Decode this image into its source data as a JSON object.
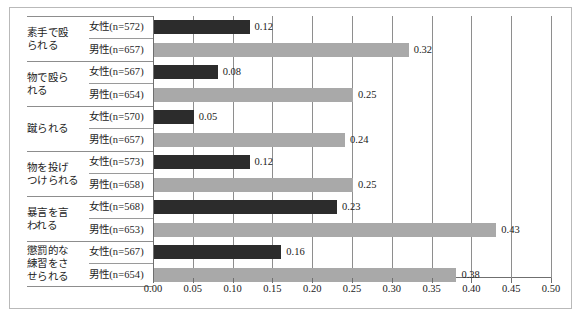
{
  "chart_data": {
    "type": "bar",
    "orientation": "horizontal",
    "title": "",
    "xlabel": "",
    "ylabel": "",
    "xlim": [
      0.0,
      0.5
    ],
    "xticks": [
      "0.00",
      "0.05",
      "0.10",
      "0.15",
      "0.20",
      "0.25",
      "0.30",
      "0.35",
      "0.40",
      "0.45",
      "0.50"
    ],
    "xtick_values": [
      0.0,
      0.05,
      0.1,
      0.15,
      0.2,
      0.25,
      0.3,
      0.35,
      0.4,
      0.45,
      0.5
    ],
    "grid": true,
    "grid_axis": "x",
    "legend": "none",
    "categories": [
      "素手で殴られる",
      "物で殴られる",
      "蹴られる",
      "物を投げつけられる",
      "暴言を言われる",
      "懲罰的な練習をさせられる"
    ],
    "series": [
      {
        "name": "女性",
        "color": "#2c2c2c",
        "values": [
          0.12,
          0.08,
          0.05,
          0.12,
          0.23,
          0.16
        ],
        "value_labels": [
          "0.12",
          "0.08",
          "0.05",
          "0.12",
          "0.23",
          "0.16"
        ],
        "n_labels": [
          "女性(n=572)",
          "女性(n=567)",
          "女性(n=570)",
          "女性(n=573)",
          "女性(n=568)",
          "女性(n=567)"
        ],
        "n_values": [
          572,
          567,
          570,
          573,
          568,
          567
        ]
      },
      {
        "name": "男性",
        "color": "#a9a9a9",
        "values": [
          0.32,
          0.25,
          0.24,
          0.25,
          0.43,
          0.38
        ],
        "value_labels": [
          "0.32",
          "0.25",
          "0.24",
          "0.25",
          "0.43",
          "0.38"
        ],
        "n_labels": [
          "男性(n=657)",
          "男性(n=654)",
          "男性(n=657)",
          "男性(n=658)",
          "男性(n=653)",
          "男性(n=654)"
        ],
        "n_values": [
          657,
          654,
          657,
          658,
          653,
          654
        ]
      }
    ]
  },
  "category_lines": [
    [
      "素手で殴",
      "られる"
    ],
    [
      "物で殴ら",
      "れる"
    ],
    [
      "蹴られる"
    ],
    [
      "物を投げ",
      "つけられる"
    ],
    [
      "暴言を言",
      "われる"
    ],
    [
      "懲罰的な",
      "練習をさ",
      "せられる"
    ]
  ],
  "colors": {
    "female_bar": "#2c2c2c",
    "male_bar": "#a9a9a9",
    "axis": "#6f6f6f",
    "gridline": "#8e8e8e",
    "frame": "#b9b9b9",
    "text": "#1a1a1a"
  }
}
